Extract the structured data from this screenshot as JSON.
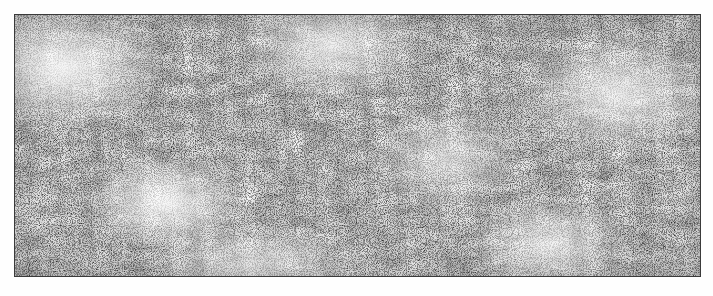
{
  "page": {
    "background_color": "#ffffff",
    "width": 713,
    "height": 296
  },
  "figure": {
    "kind": "scanned-halftone-texture-plate",
    "caption": "",
    "frame": {
      "border_color": "#3a3a3a",
      "border_width_px": 1,
      "left_px": 14,
      "top_px": 14,
      "width_px": 687,
      "height_px": 263
    },
    "texture": {
      "rendering": "dithered-grayscale-noise",
      "tone_light": "#ffffff",
      "tone_mid": "#b4b4b4",
      "tone_dark": "#5a5a5a",
      "streak_orientation": "lower-left-to-upper-right",
      "grain_scale": "per-pixel"
    }
  }
}
